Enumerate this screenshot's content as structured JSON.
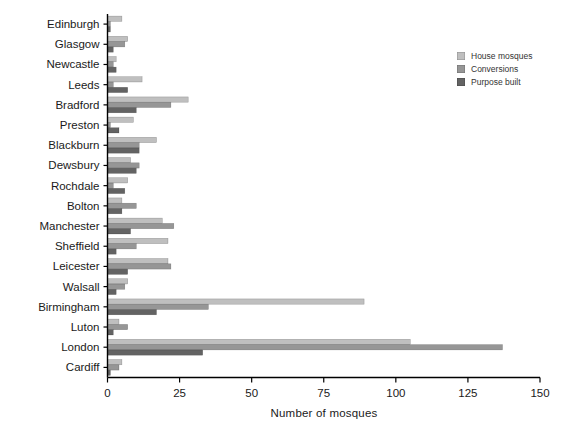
{
  "chart_data": {
    "type": "bar",
    "orientation": "horizontal",
    "title": "",
    "xlabel": "Number of mosques",
    "ylabel": "",
    "xlim": [
      0,
      150
    ],
    "xticks": [
      0,
      25,
      50,
      75,
      100,
      125,
      150
    ],
    "grid": false,
    "legend_position": "top-right",
    "background_color": "#ffffff",
    "axis_color": "#000000",
    "text_color": "#1a1a1a",
    "categories": [
      "Edinburgh",
      "Glasgow",
      "Newcastle",
      "Leeds",
      "Bradford",
      "Preston",
      "Blackburn",
      "Dewsbury",
      "Rochdale",
      "Bolton",
      "Manchester",
      "Sheffield",
      "Leicester",
      "Walsall",
      "Birmingham",
      "Luton",
      "London",
      "Cardiff"
    ],
    "series": [
      {
        "name": "House mosques",
        "color": "#bfbfbf",
        "values": [
          5,
          7,
          3,
          12,
          28,
          9,
          17,
          8,
          7,
          5,
          19,
          21,
          21,
          7,
          89,
          4,
          105,
          5
        ]
      },
      {
        "name": "Conversions",
        "color": "#969696",
        "values": [
          1,
          6,
          2,
          2,
          22,
          1,
          11,
          11,
          2,
          10,
          23,
          10,
          22,
          6,
          35,
          7,
          137,
          4
        ]
      },
      {
        "name": "Purpose built",
        "color": "#636363",
        "values": [
          1,
          2,
          3,
          7,
          10,
          4,
          11,
          10,
          6,
          5,
          8,
          3,
          7,
          3,
          17,
          2,
          33,
          1
        ]
      }
    ]
  }
}
